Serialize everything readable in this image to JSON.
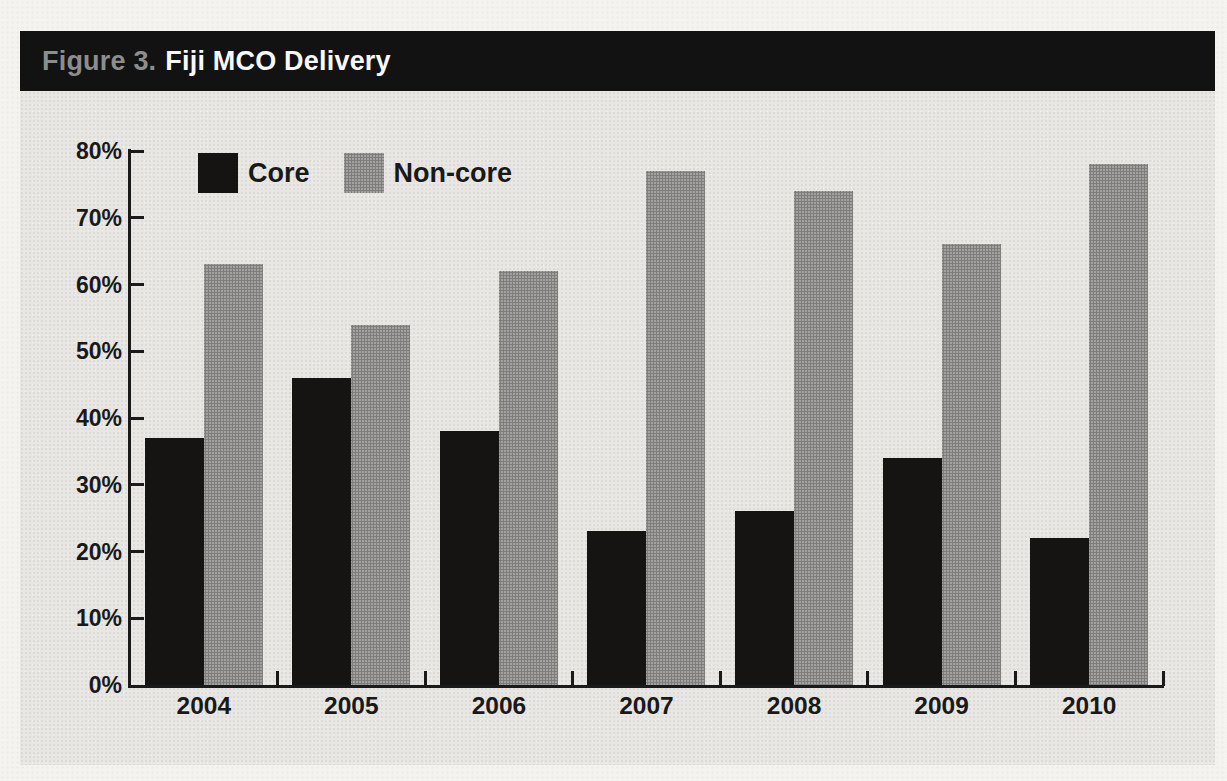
{
  "figure": {
    "label": "Figure 3.",
    "title": "Fiji MCO Delivery"
  },
  "legend": {
    "items": [
      {
        "key": "core",
        "label": "Core"
      },
      {
        "key": "noncore",
        "label": "Non-core"
      }
    ]
  },
  "chart_data": {
    "type": "bar",
    "title": "Fiji MCO Delivery",
    "categories": [
      "2004",
      "2005",
      "2006",
      "2007",
      "2008",
      "2009",
      "2010"
    ],
    "series": [
      {
        "name": "Core",
        "key": "core",
        "color": "#151413",
        "values": [
          37,
          46,
          38,
          23,
          26,
          34,
          22
        ]
      },
      {
        "name": "Non-core",
        "key": "noncore",
        "color": "#a09f9d",
        "values": [
          63,
          54,
          62,
          77,
          74,
          66,
          78
        ]
      }
    ],
    "xlabel": "",
    "ylabel": "",
    "ylim": [
      0,
      80
    ],
    "y_tick_labels": [
      "0%",
      "10%",
      "20%",
      "30%",
      "40%",
      "50%",
      "60%",
      "70%",
      "80%"
    ],
    "grid": false,
    "legend_position": "inside-top-left",
    "units": "percent"
  },
  "colors": {
    "page_bg": "#f4f3f0",
    "panel_bg": "#e8e7e3",
    "title_bar_bg": "#121212",
    "figure_label": "#8d8d8d",
    "figure_title": "#f8f8f8",
    "axis": "#1a1a1a",
    "text": "#191919",
    "core_bar": "#151413",
    "noncore_bar": "#a3a2a0"
  }
}
